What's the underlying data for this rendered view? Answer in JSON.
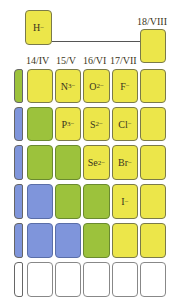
{
  "top": {
    "hydride": {
      "symbol": "H",
      "charge": "−"
    },
    "group18_label": "18/VIII"
  },
  "group_headers": [
    "14/IV",
    "15/V",
    "16/VI",
    "17/VII"
  ],
  "ions": {
    "N": {
      "symbol": "N",
      "charge": "3−"
    },
    "O": {
      "symbol": "O",
      "charge": "2−"
    },
    "F": {
      "symbol": "F",
      "charge": "−"
    },
    "P": {
      "symbol": "P",
      "charge": "3−"
    },
    "S": {
      "symbol": "S",
      "charge": "2−"
    },
    "Cl": {
      "symbol": "Cl",
      "charge": "−"
    },
    "Se": {
      "symbol": "Se",
      "charge": "2−"
    },
    "Br": {
      "symbol": "Br",
      "charge": "−"
    },
    "I": {
      "symbol": "I",
      "charge": "−"
    }
  },
  "colors": {
    "nonmetal_yellow": "#ece64a",
    "metalloid_green": "#9cc23c",
    "metal_blue": "#7f95db",
    "empty_white": "#ffffff"
  }
}
